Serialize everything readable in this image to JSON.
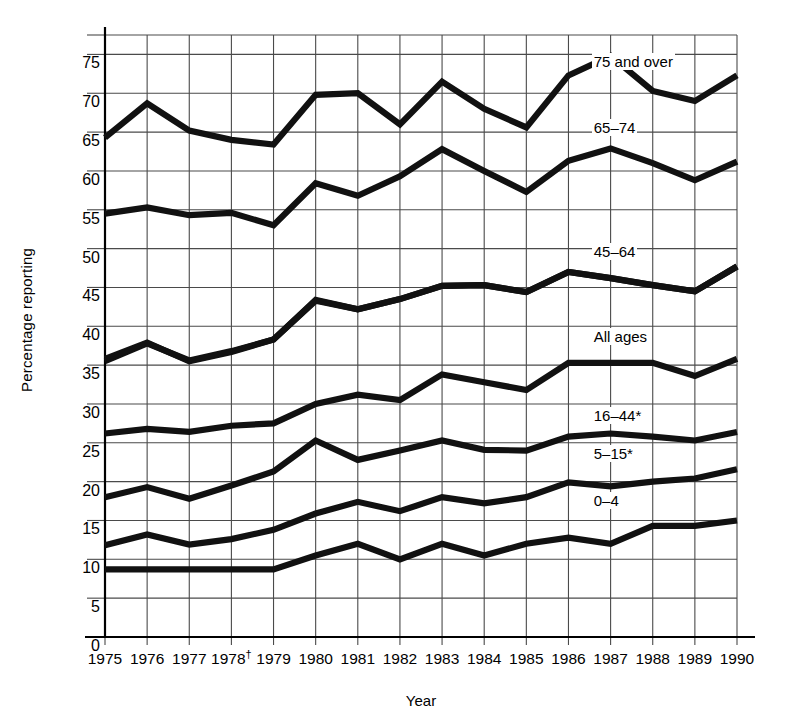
{
  "chart_data": {
    "type": "line",
    "title": "",
    "xlabel": "Year",
    "ylabel": "Percentage reporting",
    "x": [
      1975,
      1976,
      1977,
      1978,
      1979,
      1980,
      1981,
      1982,
      1983,
      1984,
      1985,
      1986,
      1987,
      1988,
      1989,
      1990
    ],
    "xtick_labels": [
      "1975",
      "1976",
      "1977",
      "1978†",
      "1979",
      "1980",
      "1981",
      "1982",
      "1983",
      "1984",
      "1985",
      "1986",
      "1987",
      "1988",
      "1989",
      "1990"
    ],
    "ytick_labels": [
      "75",
      "70",
      "65",
      "60",
      "55",
      "50",
      "45",
      "40",
      "35",
      "30",
      "25",
      "20",
      "15",
      "10",
      "5",
      "0"
    ],
    "ytick_values": [
      75,
      70,
      65,
      60,
      55,
      50,
      45,
      40,
      35,
      30,
      25,
      20,
      15,
      10,
      5,
      0
    ],
    "ylim": [
      0,
      77.5
    ],
    "xlim": [
      1975,
      1990
    ],
    "grid": true,
    "legend_position": "inline-right",
    "line_color": "#111111",
    "grid_color": "#4a4a4a",
    "series": [
      {
        "name": "75 and over",
        "label": "75 and over",
        "label_x": 1986.6,
        "label_y": 74.2,
        "values": [
          64.3,
          68.7,
          65.2,
          64.0,
          63.4,
          69.8,
          70.0,
          66.0,
          71.5,
          68.0,
          65.6,
          72.3,
          74.8,
          70.3,
          69.0,
          72.3
        ]
      },
      {
        "name": "65-74",
        "label": "65–74",
        "label_x": 1986.6,
        "label_y": 65.7,
        "values": [
          54.5,
          55.3,
          54.3,
          54.6,
          53.0,
          58.4,
          56.8,
          59.3,
          62.8,
          60.0,
          57.3,
          61.3,
          62.9,
          61.0,
          58.8,
          61.2
        ]
      },
      {
        "name": "45-64",
        "label": "45–64",
        "label_x": 1986.6,
        "label_y": 49.7,
        "values": [
          35.5,
          37.8,
          35.6,
          36.8,
          38.3,
          43.4,
          42.2,
          43.5,
          45.2,
          45.3,
          44.4,
          47.0,
          46.2,
          45.3,
          44.5,
          47.7
        ]
      },
      {
        "name": "All ages",
        "label": "All ages",
        "label_x": 1986.6,
        "label_y": 38.8,
        "values": [
          35.8,
          37.9,
          35.5,
          36.7,
          38.3,
          43.3,
          42.2,
          43.5,
          45.2,
          45.3,
          44.4,
          47.0,
          46.2,
          45.3,
          44.5,
          47.7
        ]
      },
      {
        "name": "16-44*",
        "label": "16–44*",
        "label_x": 1986.6,
        "label_y": 28.6,
        "values": [
          26.2,
          26.8,
          26.4,
          27.2,
          27.5,
          30.0,
          31.2,
          30.5,
          33.8,
          32.8,
          31.8,
          35.3,
          35.3,
          35.3,
          33.6,
          35.8
        ]
      },
      {
        "name": "5-15*",
        "label": "5–15*",
        "label_x": 1986.6,
        "label_y": 23.7,
        "values": [
          18.0,
          19.3,
          17.8,
          19.5,
          21.3,
          25.3,
          22.8,
          24.0,
          25.3,
          24.1,
          24.0,
          25.8,
          26.2,
          25.8,
          25.3,
          26.4
        ]
      },
      {
        "name": "0-4",
        "label": "0–4",
        "label_x": 1986.6,
        "label_y": 17.6,
        "values": [
          11.8,
          13.2,
          11.9,
          12.6,
          13.8,
          15.9,
          17.4,
          16.2,
          18.0,
          17.2,
          18.0,
          19.9,
          19.4,
          20.0,
          20.4,
          21.6
        ]
      },
      {
        "name": "unlabeled-lowest",
        "label": "",
        "label_x": null,
        "label_y": null,
        "values": [
          8.7,
          8.7,
          8.7,
          8.7,
          8.7,
          10.5,
          12.0,
          10.0,
          12.0,
          10.5,
          12.0,
          12.8,
          12.0,
          14.3,
          14.3,
          15.0
        ]
      }
    ],
    "footnote_markers": [
      "†",
      "*"
    ]
  }
}
